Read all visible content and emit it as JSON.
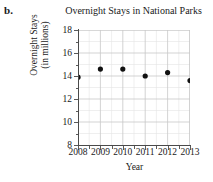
{
  "part_label": "b.",
  "chart_data": {
    "type": "scatter",
    "title": "Overnight Stays in National Parks",
    "xlabel": "Year",
    "ylabel_line1": "Overnight Stays",
    "ylabel_line2": "(in millions)",
    "x": [
      2008,
      2009,
      2010,
      2011,
      2012,
      2013
    ],
    "values": [
      13.9,
      14.6,
      14.6,
      14.0,
      14.3,
      13.6
    ],
    "categories": [
      "2008",
      "2009",
      "2010",
      "2011",
      "2012",
      "2013"
    ],
    "xtick_labels": [
      "2008",
      "2009",
      "2010",
      "2011",
      "2012",
      "2013"
    ],
    "ytick_labels": [
      "18",
      "16",
      "14",
      "12",
      "10",
      "8"
    ],
    "yticks": [
      18,
      16,
      14,
      12,
      10,
      8
    ],
    "ylim": [
      8,
      18
    ],
    "xlim": [
      2008,
      2013
    ],
    "grid": true,
    "minor_grid": true,
    "legend": "none",
    "marker": "filled-circle",
    "marker_color": "#111111",
    "grid_color": "#c8c8c8",
    "minor_grid_color": "#e4e4e4",
    "axis_color": "#4a4a4a",
    "background": "#ffffff"
  }
}
